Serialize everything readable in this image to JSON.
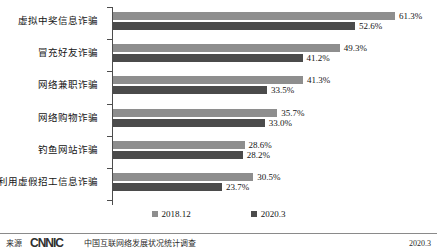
{
  "chart_data": {
    "type": "bar",
    "orientation": "horizontal",
    "title": "",
    "xlabel": "",
    "ylabel": "",
    "grid": false,
    "legend_position": "bottom",
    "xlim": [
      0,
      70
    ],
    "categories": [
      "虚拟中奖信息诈骗",
      "冒充好友诈骗",
      "网络兼职诈骗",
      "网络购物诈骗",
      "钓鱼网站诈骗",
      "利用虚假招工信息诈骗"
    ],
    "series": [
      {
        "name": "2018.12",
        "color": "#8e8e8e",
        "values": [
          61.3,
          49.3,
          41.3,
          35.7,
          28.6,
          30.5
        ],
        "labels": [
          "61.3%",
          "49.3%",
          "41.3%",
          "35.7%",
          "28.6%",
          "30.5%"
        ]
      },
      {
        "name": "2020.3",
        "color": "#4b4b4b",
        "values": [
          52.6,
          41.2,
          33.5,
          33.0,
          28.2,
          23.7
        ],
        "labels": [
          "52.6%",
          "41.2%",
          "33.5%",
          "33.0%",
          "28.2%",
          "23.7%"
        ]
      }
    ]
  },
  "legend": {
    "items": [
      {
        "label": "2018.12"
      },
      {
        "label": "2020.3"
      }
    ]
  },
  "footer": {
    "source_label": "来源",
    "logo_text": "CNNIC",
    "source_text": "中国互联网络发展状况统计调查",
    "date": "2020.3"
  }
}
